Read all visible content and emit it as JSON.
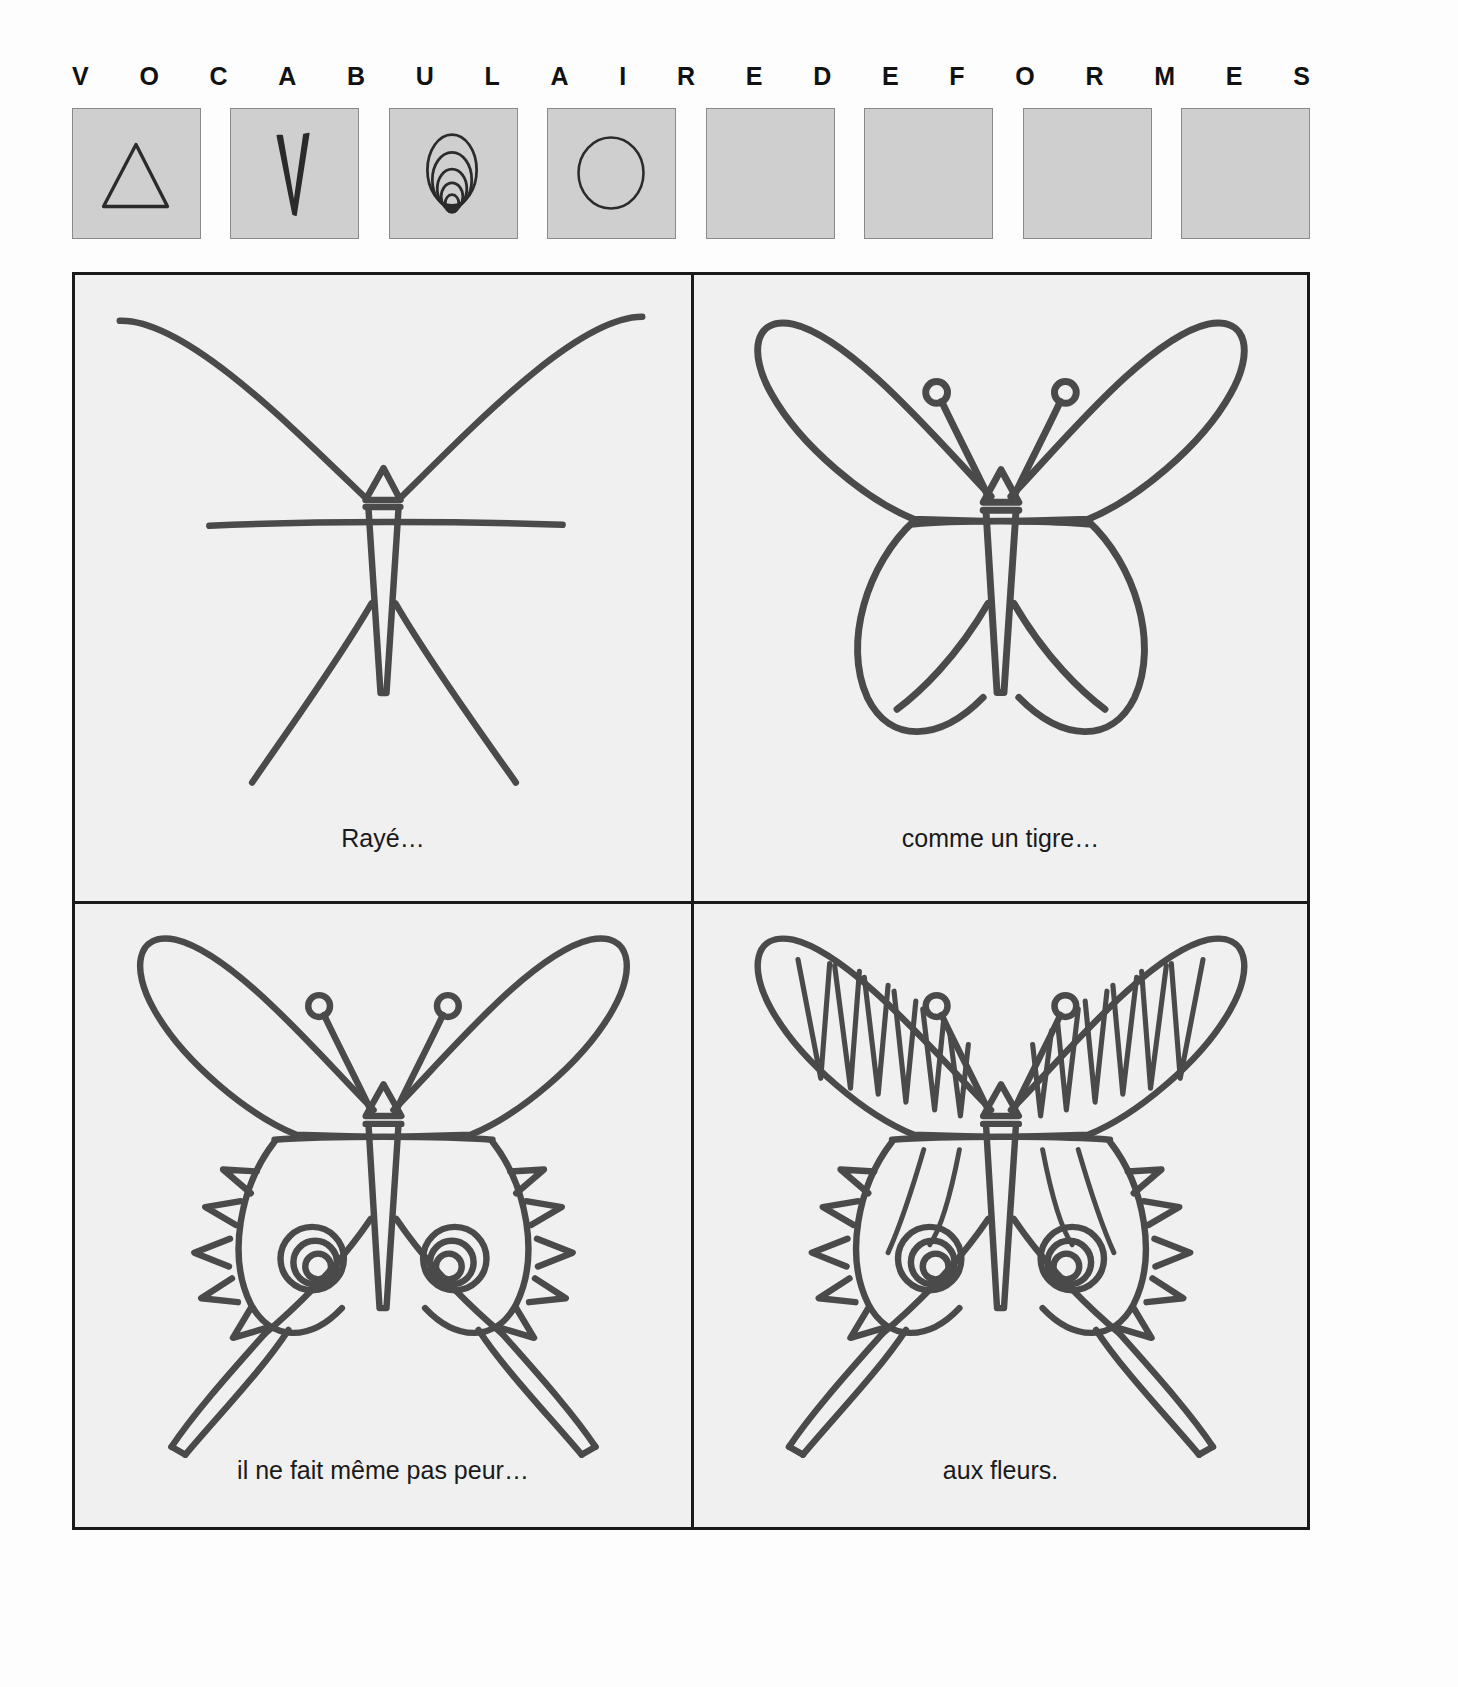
{
  "header": {
    "letters": [
      "V",
      "O",
      "C",
      "A",
      "B",
      "U",
      "L",
      "A",
      "I",
      "R",
      "E",
      "D",
      "E",
      "F",
      "O",
      "R",
      "M",
      "E",
      "S"
    ]
  },
  "vocabulary": {
    "label": "shape-vocabulary-boxes",
    "fill_color": "#cfcfcf",
    "border_color": "#8a8a8a",
    "boxes": [
      {
        "index": 1,
        "shape": "triangle",
        "icon": "triangle-icon",
        "filled": true
      },
      {
        "index": 2,
        "shape": "narrow-v",
        "icon": "v-stripe-icon",
        "filled": true
      },
      {
        "index": 3,
        "shape": "concentric-ovals",
        "icon": "spiral-ovals-icon",
        "filled": true
      },
      {
        "index": 4,
        "shape": "circle",
        "icon": "circle-icon",
        "filled": true
      },
      {
        "index": 5,
        "shape": "empty",
        "icon": "empty-slot-icon",
        "filled": false
      },
      {
        "index": 6,
        "shape": "empty",
        "icon": "empty-slot-icon",
        "filled": false
      },
      {
        "index": 7,
        "shape": "empty",
        "icon": "empty-slot-icon",
        "filled": false
      },
      {
        "index": 8,
        "shape": "empty",
        "icon": "empty-slot-icon",
        "filled": false
      }
    ]
  },
  "panels": [
    {
      "id": "panel-1",
      "caption": "Rayé…",
      "drawing": "butterfly-skeleton",
      "description": "construction lines: curved upper wing strokes, horizontal axis, triangle head, narrow body, lower diagonal strokes"
    },
    {
      "id": "panel-2",
      "caption": "comme un tigre…",
      "drawing": "butterfly-outline",
      "description": "closed upper and lower wing outlines with antennae ending in small circles"
    },
    {
      "id": "panel-3",
      "caption": "il ne fait même pas peur…",
      "drawing": "butterfly-spikes-eyespots",
      "description": "outline plus triangular spikes on lower wing edges and spiral eye-spots"
    },
    {
      "id": "panel-4",
      "caption": "aux fleurs.",
      "drawing": "butterfly-striped",
      "description": "full pattern: V-shaped tiger stripes on upper wings, spikes, eye-spots, radiating lower wing lines"
    }
  ],
  "colors": {
    "page_background": "#fdfdfd",
    "panel_background": "#f0f0f0",
    "ink": "#3a3a3a",
    "frame": "#1a1a1a",
    "swatch_gray": "#cfcfcf"
  }
}
